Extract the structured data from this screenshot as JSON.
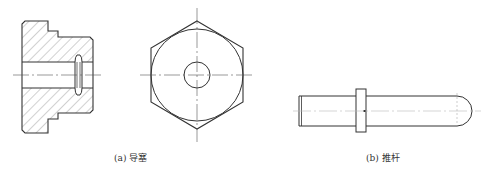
{
  "figure": {
    "captions": {
      "a": "(a) 导塞",
      "b": "(b) 推杆"
    },
    "colors": {
      "line": "#333333",
      "hatch": "#777777",
      "centerline": "#555555",
      "background": "#ffffff"
    },
    "parts": [
      {
        "id": "a",
        "name": "导塞",
        "views": [
          "section-view",
          "end-view-hexagon"
        ]
      },
      {
        "id": "b",
        "name": "推杆",
        "views": [
          "side-view"
        ]
      }
    ]
  }
}
